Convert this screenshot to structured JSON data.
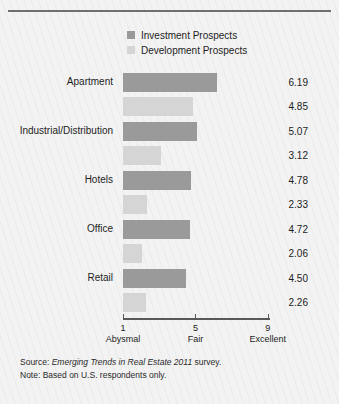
{
  "figure": {
    "background_color": "#f2f2f2",
    "border_color": "#6f6f6f"
  },
  "legend": {
    "position": "top-center",
    "items": [
      {
        "label": "Investment Prospects",
        "color": "#9a9a9a",
        "swatch_name": "legend-swatch-investment"
      },
      {
        "label": "Development Prospects",
        "color": "#d5d5d5",
        "swatch_name": "legend-swatch-development"
      }
    ]
  },
  "axis": {
    "ticks": [
      {
        "num": "1",
        "word": "Abysmal",
        "value": 1
      },
      {
        "num": "5",
        "word": "Fair",
        "value": 5
      },
      {
        "num": "9",
        "word": "Excellent",
        "value": 9
      }
    ],
    "min": 1,
    "max": 9,
    "line_color": "#585858"
  },
  "footer": {
    "source_prefix": "Source: ",
    "source_title": "Emerging Trends in Real Estate 2011",
    "source_suffix": " survey.",
    "note": "Note: Based on U.S. respondents only."
  },
  "chart_data": {
    "type": "bar",
    "orientation": "horizontal",
    "title": "",
    "subtitle": "",
    "xlabel": "",
    "ylabel": "",
    "xlim": [
      1,
      9
    ],
    "grid": false,
    "legend_position": "top-center",
    "categories": [
      "Apartment",
      "Industrial/Distribution",
      "Hotels",
      "Office",
      "Retail"
    ],
    "series": [
      {
        "name": "Investment Prospects",
        "color": "#9a9a9a",
        "values": [
          6.19,
          5.07,
          4.78,
          4.72,
          4.5
        ],
        "labels": [
          "6.19",
          "5.07",
          "4.78",
          "4.72",
          "4.50"
        ]
      },
      {
        "name": "Development Prospects",
        "color": "#d5d5d5",
        "values": [
          4.85,
          3.12,
          2.33,
          2.06,
          2.26
        ],
        "labels": [
          "4.85",
          "3.12",
          "2.33",
          "2.06",
          "2.26"
        ]
      }
    ],
    "tick_labels": [
      "1 Abysmal",
      "5 Fair",
      "9 Excellent"
    ],
    "annotations": [
      "Source: Emerging Trends in Real Estate 2011 survey.",
      "Note: Based on U.S. respondents only."
    ]
  }
}
